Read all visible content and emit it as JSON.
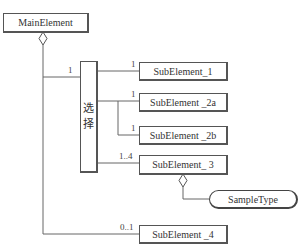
{
  "diagram": {
    "type": "xml-schema-structure",
    "root": {
      "label": "MainElement"
    },
    "choice": {
      "label_line1": "选",
      "label_line2": "择",
      "multiplicity": "1"
    },
    "elements": [
      {
        "label": "SubElement_1",
        "multiplicity": "1"
      },
      {
        "label": "SubElement _2a",
        "multiplicity": "1"
      },
      {
        "label": "SubElement _2b",
        "multiplicity": "1"
      },
      {
        "label": "SubElement_ 3",
        "multiplicity": "1..4"
      },
      {
        "label": "SubElement _4",
        "multiplicity": "0..1"
      }
    ],
    "type_node": {
      "label": "SampleType"
    }
  }
}
